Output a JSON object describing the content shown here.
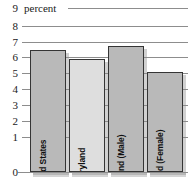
{
  "chart_data": {
    "type": "bar",
    "title": "",
    "subtitle": "",
    "xlabel": "",
    "ylabel": "percent",
    "ylim": [
      0,
      9
    ],
    "grid": true,
    "legend": "none",
    "y_ticks": [
      9,
      8,
      7,
      6,
      5,
      4,
      3,
      2,
      1,
      0
    ],
    "categories": [
      "United States",
      "Maryland",
      "Maryland (Male)",
      "Maryland (Female)"
    ],
    "values": [
      6.7,
      6.2,
      6.9,
      5.5
    ],
    "series": [
      {
        "name": "percent",
        "values": [
          6.7,
          6.2,
          6.9,
          5.5
        ]
      }
    ],
    "bar_shades": [
      "dark",
      "light",
      "dark",
      "dark"
    ],
    "colors": {
      "bar_dark": "#b9b9b9",
      "bar_light": "#dedede",
      "bar_border": "#353535",
      "gridline": "#8d8d8d",
      "text": "#1a1a1a",
      "shadow": "#8c8c8c"
    }
  }
}
